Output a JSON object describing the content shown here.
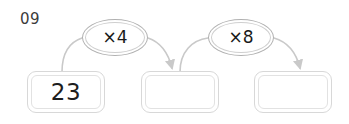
{
  "worksheet": {
    "question_number": "09",
    "background_color": "#ffffff"
  },
  "chain": {
    "boxes": [
      {
        "name": "start-value",
        "value": "23",
        "filled": true
      },
      {
        "name": "first-result",
        "value": "",
        "filled": false
      },
      {
        "name": "second-result",
        "value": "",
        "filled": false
      }
    ],
    "operations": [
      {
        "name": "multiply-by-four",
        "label": "×4"
      },
      {
        "name": "multiply-by-eight",
        "label": "×8"
      }
    ],
    "arrows": [
      {
        "name": "arrow-box1-to-box2"
      },
      {
        "name": "arrow-box2-to-box3"
      }
    ]
  },
  "colors": {
    "box_border": "#d8d8d8",
    "box_inner_border": "#e2e2e2",
    "oval_border": "#b0b0b0",
    "arrow": "#c9c9c9",
    "text": "#1d1d1d",
    "question_number": "#3b3b3b"
  }
}
